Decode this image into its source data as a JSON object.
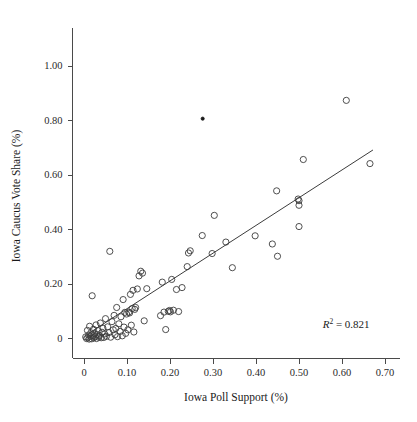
{
  "chart_data": {
    "type": "scatter",
    "title": "",
    "xlabel": "Iowa Poll Support (%)",
    "ylabel": "Iowa Caucus Vote Share (%)",
    "xlim": [
      -0.022,
      0.735
    ],
    "ylim": [
      -0.055,
      1.06
    ],
    "grid": false,
    "legend": null,
    "xticks": [
      0,
      0.1,
      0.2,
      0.3,
      0.4,
      0.5,
      0.6,
      0.7
    ],
    "xticklabels": [
      "0",
      "0.10",
      "0.20",
      "0.30",
      "0.40",
      "0.50",
      "0.60",
      "0.70"
    ],
    "yticks": [
      0,
      0.2,
      0.4,
      0.6,
      0.8,
      1.0
    ],
    "yticklabels": [
      "0",
      "0.20",
      "0.40",
      "0.60",
      "0.80",
      "1.00"
    ],
    "annotations": [
      {
        "name": "r-squared",
        "text": "R2 = 0.821",
        "r_symbol": "R",
        "exponent": "2",
        "equals": "=",
        "value": "0.821",
        "x": 0.555,
        "y": 0.035
      }
    ],
    "series": [
      {
        "name": "candidates",
        "marker": "open-circle",
        "color": "#3c3c3c",
        "points": [
          [
            0.004,
            0.004
          ],
          [
            0.006,
            -0.002
          ],
          [
            0.008,
            0.028
          ],
          [
            0.009,
            0.002
          ],
          [
            0.011,
            0.011
          ],
          [
            0.012,
            -0.004
          ],
          [
            0.013,
            0.043
          ],
          [
            0.015,
            0.006
          ],
          [
            0.016,
            0.019
          ],
          [
            0.018,
            -0.003
          ],
          [
            0.019,
            0.155
          ],
          [
            0.021,
            0.008
          ],
          [
            0.022,
            0.032
          ],
          [
            0.023,
            0.001
          ],
          [
            0.025,
            0.016
          ],
          [
            0.026,
            0.005
          ],
          [
            0.028,
            0.048
          ],
          [
            0.029,
            -0.002
          ],
          [
            0.031,
            0.013
          ],
          [
            0.033,
            0.027
          ],
          [
            0.034,
            0.003
          ],
          [
            0.036,
            0.009
          ],
          [
            0.038,
            0.055
          ],
          [
            0.04,
            0.001
          ],
          [
            0.042,
            0.021
          ],
          [
            0.044,
            0.036
          ],
          [
            0.046,
            0.002
          ],
          [
            0.048,
            0.015
          ],
          [
            0.05,
            0.071
          ],
          [
            0.052,
            0.006
          ],
          [
            0.055,
            0.041
          ],
          [
            0.058,
            0.02
          ],
          [
            0.06,
            0.318
          ],
          [
            0.062,
            0.003
          ],
          [
            0.065,
            0.06
          ],
          [
            0.068,
            0.03
          ],
          [
            0.07,
            0.083
          ],
          [
            0.072,
            0.012
          ],
          [
            0.074,
            0.035
          ],
          [
            0.076,
            0.112
          ],
          [
            0.078,
            0.005
          ],
          [
            0.081,
            0.052
          ],
          [
            0.084,
            0.024
          ],
          [
            0.086,
            0.078
          ],
          [
            0.089,
            0.008
          ],
          [
            0.091,
            0.141
          ],
          [
            0.093,
            0.04
          ],
          [
            0.095,
            0.094
          ],
          [
            0.097,
            0.017
          ],
          [
            0.099,
            0.088
          ],
          [
            0.102,
            0.03
          ],
          [
            0.104,
            0.095
          ],
          [
            0.106,
            0.092
          ],
          [
            0.108,
            0.16
          ],
          [
            0.11,
            0.047
          ],
          [
            0.112,
            0.108
          ],
          [
            0.114,
            0.175
          ],
          [
            0.116,
            0.022
          ],
          [
            0.118,
            0.105
          ],
          [
            0.12,
            0.112
          ],
          [
            0.124,
            0.18
          ],
          [
            0.128,
            0.228
          ],
          [
            0.132,
            0.245
          ],
          [
            0.136,
            0.238
          ],
          [
            0.14,
            0.063
          ],
          [
            0.146,
            0.181
          ],
          [
            0.178,
            0.082
          ],
          [
            0.182,
            0.205
          ],
          [
            0.186,
            0.095
          ],
          [
            0.19,
            0.031
          ],
          [
            0.196,
            0.098
          ],
          [
            0.199,
            0.101
          ],
          [
            0.201,
            0.096
          ],
          [
            0.204,
            0.215
          ],
          [
            0.208,
            0.102
          ],
          [
            0.215,
            0.178
          ],
          [
            0.22,
            0.097
          ],
          [
            0.228,
            0.185
          ],
          [
            0.24,
            0.262
          ],
          [
            0.243,
            0.312
          ],
          [
            0.247,
            0.32
          ],
          [
            0.275,
            0.376
          ],
          [
            0.298,
            0.31
          ],
          [
            0.303,
            0.45
          ],
          [
            0.33,
            0.352
          ],
          [
            0.345,
            0.258
          ],
          [
            0.398,
            0.375
          ],
          [
            0.438,
            0.345
          ],
          [
            0.448,
            0.54
          ],
          [
            0.45,
            0.3
          ],
          [
            0.498,
            0.51
          ],
          [
            0.5,
            0.504
          ],
          [
            0.5,
            0.487
          ],
          [
            0.5,
            0.409
          ],
          [
            0.51,
            0.655
          ],
          [
            0.61,
            0.872
          ],
          [
            0.665,
            0.64
          ]
        ]
      },
      {
        "name": "outlier-filled",
        "marker": "filled-dot",
        "color": "#1a1a1a",
        "points": [
          [
            0.276,
            0.805
          ]
        ]
      }
    ],
    "fit_line": {
      "name": "least-squares-fit",
      "x_start": 0.012,
      "y_start": 0.018,
      "x_end": 0.672,
      "y_end": 0.69,
      "r_squared": 0.821
    }
  }
}
